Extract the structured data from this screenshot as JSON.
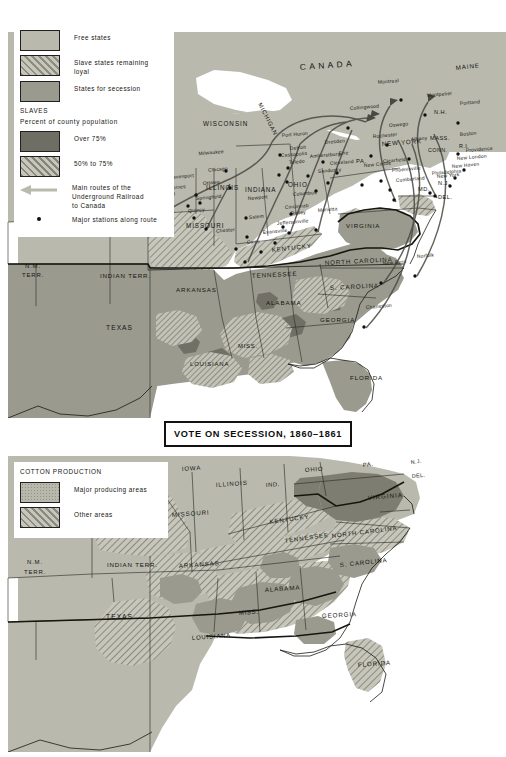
{
  "page": {
    "background": "#ffffff",
    "width": 506,
    "height": 757
  },
  "colors": {
    "free_states": "#b9b9ae",
    "loyal_slave_states_base": "#c3c3b6",
    "secession_states": "#9a9a8e",
    "over_75": "#6e6e64",
    "fifty_to_75_base": "#c0c0b4",
    "water": "#ffffff",
    "canada": "#b9b9ae",
    "outline": "#1b1b17",
    "text": "#15150f",
    "route_line": "#3a3a36",
    "cotton_major": "#9a9a8e",
    "cotton_other_base": "#c3c3b6",
    "cotton_virginia": "#7d7d72"
  },
  "top_map": {
    "name": "underground-railroad-and-secession-map",
    "title_plate": {
      "label": "VOTE ON SECESSION, 1860–1861"
    },
    "legend": {
      "name": "top-map-legend",
      "entries": [
        {
          "id": "free-states",
          "label": "Free states",
          "swatch": "plain",
          "color": "#b9b9ae"
        },
        {
          "id": "loyal-slave-states",
          "label": "Slave states remaining\n      loyal",
          "swatch": "hatch",
          "color": "#c3c3b6"
        },
        {
          "id": "secession-states",
          "label": "States for secession",
          "swatch": "plain",
          "color": "#9a9a8e"
        }
      ],
      "slaves_heading_line1": "SLAVES",
      "slaves_heading_line2": "Percent of county population",
      "slaves_entries": [
        {
          "id": "over-75",
          "label": "Over 75%",
          "swatch": "plain",
          "color": "#6e6e64"
        },
        {
          "id": "fifty-to-seventyfive",
          "label": "50% to 75%",
          "swatch": "hatch",
          "color": "#c0c0b4"
        }
      ],
      "route_label": "Main routes of the\n      Underground Railroad\n      to Canada",
      "station_label": "Major stations along route"
    },
    "region_labels": [
      {
        "text": "CANADA",
        "x": 300,
        "y": 70,
        "size": 8.4,
        "spacing": 3.4,
        "rot": -4,
        "weight": "normal"
      },
      {
        "text": "WISCONSIN",
        "x": 203,
        "y": 126,
        "size": 6.3,
        "spacing": 1.0,
        "rot": 0
      },
      {
        "text": "MICHIGAN",
        "x": 258,
        "y": 104,
        "size": 5.9,
        "spacing": 0.8,
        "rot": 63
      },
      {
        "text": "IOWA",
        "x": 151,
        "y": 160,
        "size": 6.3,
        "spacing": 1.0,
        "rot": 0
      },
      {
        "text": "ILLINOIS",
        "x": 206,
        "y": 190,
        "size": 6.3,
        "spacing": 0.9,
        "rot": 0
      },
      {
        "text": "INDIANA",
        "x": 245,
        "y": 192,
        "size": 6.3,
        "spacing": 0.8,
        "rot": 0
      },
      {
        "text": "OHIO",
        "x": 288,
        "y": 187,
        "size": 6.3,
        "spacing": 0.9,
        "rot": 0
      },
      {
        "text": "MISSOURI",
        "x": 186,
        "y": 228,
        "size": 6.3,
        "spacing": 0.9,
        "rot": 0
      },
      {
        "text": "KANSAS TERRITORY",
        "x": 60,
        "y": 232,
        "size": 6.6,
        "spacing": 1.2,
        "rot": 0
      },
      {
        "text": "N.M.",
        "x": 25,
        "y": 268,
        "size": 6.0,
        "spacing": 0.8,
        "rot": 0
      },
      {
        "text": "TERR.",
        "x": 22,
        "y": 277,
        "size": 6.0,
        "spacing": 0.8,
        "rot": 0
      },
      {
        "text": "INDIAN TERR.",
        "x": 100,
        "y": 278,
        "size": 6.2,
        "spacing": 0.8,
        "rot": 0
      },
      {
        "text": "ARKANSAS",
        "x": 176,
        "y": 292,
        "size": 6.2,
        "spacing": 0.9,
        "rot": 0
      },
      {
        "text": "TENNESSEE",
        "x": 252,
        "y": 278,
        "size": 6.2,
        "spacing": 0.9,
        "rot": -3
      },
      {
        "text": "KENTUCKY",
        "x": 272,
        "y": 252,
        "size": 6.2,
        "spacing": 0.8,
        "rot": -6
      },
      {
        "text": "VIRGINIA",
        "x": 346,
        "y": 228,
        "size": 6.2,
        "spacing": 0.9,
        "rot": 0
      },
      {
        "text": "NORTH CAROLINA",
        "x": 325,
        "y": 265,
        "size": 6.2,
        "spacing": 0.9,
        "rot": -3
      },
      {
        "text": "S. CAROLINA",
        "x": 330,
        "y": 290,
        "size": 6.2,
        "spacing": 0.9,
        "rot": -3
      },
      {
        "text": "GEORGIA",
        "x": 320,
        "y": 322,
        "size": 6.2,
        "spacing": 0.9,
        "rot": 0
      },
      {
        "text": "ALABAMA",
        "x": 266,
        "y": 305,
        "size": 6.2,
        "spacing": 0.9,
        "rot": 0
      },
      {
        "text": "MISS.",
        "x": 238,
        "y": 348,
        "size": 6.0,
        "spacing": 0.7,
        "rot": 0
      },
      {
        "text": "LOUISIANA",
        "x": 190,
        "y": 366,
        "size": 6.0,
        "spacing": 0.8,
        "rot": 0
      },
      {
        "text": "TEXAS",
        "x": 106,
        "y": 330,
        "size": 6.6,
        "spacing": 1.1,
        "rot": 0
      },
      {
        "text": "FLORIDA",
        "x": 350,
        "y": 380,
        "size": 6.2,
        "spacing": 0.9,
        "rot": 0
      },
      {
        "text": "NEW YORK",
        "x": 382,
        "y": 146,
        "size": 6.2,
        "spacing": 0.8,
        "rot": -4
      },
      {
        "text": "PA.",
        "x": 356,
        "y": 163,
        "size": 5.8,
        "spacing": 0.6,
        "rot": 0
      },
      {
        "text": "MAINE",
        "x": 456,
        "y": 70,
        "size": 6.2,
        "spacing": 0.9,
        "rot": -6
      },
      {
        "text": "N.H.",
        "x": 434,
        "y": 114,
        "size": 5.6,
        "spacing": 0.5,
        "rot": 0
      },
      {
        "text": "MASS.",
        "x": 430,
        "y": 140,
        "size": 5.6,
        "spacing": 0.5,
        "rot": 0
      },
      {
        "text": "R.I.",
        "x": 459,
        "y": 148,
        "size": 5.4,
        "spacing": 0.4,
        "rot": 0
      },
      {
        "text": "CONN.",
        "x": 428,
        "y": 152,
        "size": 5.4,
        "spacing": 0.4,
        "rot": 0
      },
      {
        "text": "N.J.",
        "x": 438,
        "y": 185,
        "size": 5.6,
        "spacing": 0.5,
        "rot": 0
      },
      {
        "text": "DEL.",
        "x": 438,
        "y": 199,
        "size": 5.6,
        "spacing": 0.5,
        "rot": 0
      },
      {
        "text": "MD.",
        "x": 418,
        "y": 191,
        "size": 5.6,
        "spacing": 0.5,
        "rot": 0
      }
    ],
    "cities": [
      {
        "name": "Montreal",
        "x": 399,
        "y": 82,
        "anchor": "end"
      },
      {
        "name": "Montpelier",
        "x": 427,
        "y": 97,
        "anchor": "start"
      },
      {
        "name": "Portland",
        "x": 460,
        "y": 105,
        "anchor": "start"
      },
      {
        "name": "Collingwood",
        "x": 350,
        "y": 110,
        "anchor": "start"
      },
      {
        "name": "Oswego",
        "x": 389,
        "y": 127,
        "anchor": "start"
      },
      {
        "name": "Rochester",
        "x": 373,
        "y": 138,
        "anchor": "start"
      },
      {
        "name": "Albany",
        "x": 411,
        "y": 141,
        "anchor": "start"
      },
      {
        "name": "Boston",
        "x": 460,
        "y": 136,
        "anchor": "start"
      },
      {
        "name": "Providence",
        "x": 466,
        "y": 152,
        "anchor": "start"
      },
      {
        "name": "New London",
        "x": 457,
        "y": 160,
        "anchor": "start"
      },
      {
        "name": "New Haven",
        "x": 452,
        "y": 168,
        "anchor": "start"
      },
      {
        "name": "New York",
        "x": 437,
        "y": 178,
        "anchor": "start"
      },
      {
        "name": "Philadelphia",
        "x": 432,
        "y": 175,
        "anchor": "start"
      },
      {
        "name": "Clearfield",
        "x": 383,
        "y": 163,
        "anchor": "start"
      },
      {
        "name": "New Castle",
        "x": 364,
        "y": 167,
        "anchor": "start"
      },
      {
        "name": "Phoenixville",
        "x": 392,
        "y": 172,
        "anchor": "start"
      },
      {
        "name": "Cumberland",
        "x": 396,
        "y": 182,
        "anchor": "start"
      },
      {
        "name": "Erie",
        "x": 339,
        "y": 155,
        "anchor": "start"
      },
      {
        "name": "Dresden",
        "x": 325,
        "y": 144,
        "anchor": "start"
      },
      {
        "name": "Port Huron",
        "x": 282,
        "y": 137,
        "anchor": "start"
      },
      {
        "name": "Detroit",
        "x": 290,
        "y": 150,
        "anchor": "start"
      },
      {
        "name": "Cassopolis",
        "x": 281,
        "y": 157,
        "anchor": "start"
      },
      {
        "name": "Amherstburg",
        "x": 310,
        "y": 158,
        "anchor": "start"
      },
      {
        "name": "Toledo",
        "x": 289,
        "y": 164,
        "anchor": "start"
      },
      {
        "name": "Cleveland",
        "x": 330,
        "y": 165,
        "anchor": "start"
      },
      {
        "name": "Sandusky",
        "x": 318,
        "y": 173,
        "anchor": "start"
      },
      {
        "name": "Columbus",
        "x": 293,
        "y": 196,
        "anchor": "start"
      },
      {
        "name": "Cincinnati",
        "x": 285,
        "y": 209,
        "anchor": "start"
      },
      {
        "name": "Ripley",
        "x": 291,
        "y": 215,
        "anchor": "start"
      },
      {
        "name": "Marietta",
        "x": 318,
        "y": 212,
        "anchor": "start"
      },
      {
        "name": "Jeffersonville",
        "x": 277,
        "y": 225,
        "anchor": "start"
      },
      {
        "name": "Evansville",
        "x": 263,
        "y": 234,
        "anchor": "start"
      },
      {
        "name": "Salem",
        "x": 249,
        "y": 219,
        "anchor": "start"
      },
      {
        "name": "Cairo",
        "x": 247,
        "y": 244,
        "anchor": "start"
      },
      {
        "name": "Chester",
        "x": 235,
        "y": 231,
        "anchor": "end"
      },
      {
        "name": "Newport",
        "x": 248,
        "y": 200,
        "anchor": "start"
      },
      {
        "name": "Chicago",
        "x": 228,
        "y": 170,
        "anchor": "end"
      },
      {
        "name": "Milwaukee",
        "x": 224,
        "y": 153,
        "anchor": "end"
      },
      {
        "name": "Ottawa",
        "x": 203,
        "y": 185,
        "anchor": "start"
      },
      {
        "name": "Springfield",
        "x": 196,
        "y": 200,
        "anchor": "start"
      },
      {
        "name": "Davenport",
        "x": 194,
        "y": 177,
        "anchor": "end"
      },
      {
        "name": "Des Moines",
        "x": 186,
        "y": 188,
        "anchor": "end"
      },
      {
        "name": "Percival",
        "x": 156,
        "y": 197,
        "anchor": "start"
      },
      {
        "name": "Quincy",
        "x": 205,
        "y": 211,
        "anchor": "end"
      },
      {
        "name": "New Bern",
        "x": 383,
        "y": 265,
        "anchor": "start"
      },
      {
        "name": "Charleston",
        "x": 366,
        "y": 309,
        "anchor": "start"
      },
      {
        "name": "Norfolk",
        "x": 417,
        "y": 258,
        "anchor": "start"
      }
    ]
  },
  "bottom_map": {
    "name": "cotton-production-map",
    "legend": {
      "name": "cotton-legend",
      "heading": "COTTON PRODUCTION",
      "entries": [
        {
          "id": "major-producing-areas",
          "label": "Major producing areas",
          "swatch": "dots",
          "color": "#9a9a8e"
        },
        {
          "id": "other-areas",
          "label": "Other areas",
          "swatch": "hatch",
          "color": "#c3c3b6"
        }
      ]
    },
    "region_labels": [
      {
        "text": "IOWA",
        "x": 182,
        "y": 471,
        "size": 6.0,
        "spacing": 0.9,
        "rot": -4
      },
      {
        "text": "ILLINOIS",
        "x": 216,
        "y": 487,
        "size": 6.0,
        "spacing": 0.9,
        "rot": -4
      },
      {
        "text": "IND.",
        "x": 266,
        "y": 487,
        "size": 5.8,
        "spacing": 0.6,
        "rot": -4
      },
      {
        "text": "OHIO",
        "x": 305,
        "y": 472,
        "size": 6.0,
        "spacing": 0.8,
        "rot": -4
      },
      {
        "text": "PA.",
        "x": 363,
        "y": 467,
        "size": 5.8,
        "spacing": 0.6,
        "rot": -6
      },
      {
        "text": "N.J.",
        "x": 411,
        "y": 464,
        "size": 5.2,
        "spacing": 0.4,
        "rot": -6
      },
      {
        "text": "DEL.",
        "x": 412,
        "y": 478,
        "size": 5.4,
        "spacing": 0.4,
        "rot": -6
      },
      {
        "text": "VIRGINIA",
        "x": 368,
        "y": 500,
        "size": 6.2,
        "spacing": 1.0,
        "rot": -5
      },
      {
        "text": "MISSOURI",
        "x": 172,
        "y": 517,
        "size": 6.2,
        "spacing": 0.9,
        "rot": -4
      },
      {
        "text": "KENTUCKY",
        "x": 270,
        "y": 524,
        "size": 6.0,
        "spacing": 0.9,
        "rot": -8
      },
      {
        "text": "TENNESSEE",
        "x": 285,
        "y": 543,
        "size": 6.0,
        "spacing": 0.9,
        "rot": -8
      },
      {
        "text": "NORTH CAROLINA",
        "x": 332,
        "y": 538,
        "size": 6.0,
        "spacing": 0.9,
        "rot": -7
      },
      {
        "text": "S. CAROLINA",
        "x": 340,
        "y": 567,
        "size": 6.0,
        "spacing": 0.9,
        "rot": -6
      },
      {
        "text": "KANSAS TERR.",
        "x": 85,
        "y": 533,
        "size": 6.2,
        "spacing": 0.9,
        "rot": 0
      },
      {
        "text": "N.M.",
        "x": 27,
        "y": 564,
        "size": 6.0,
        "spacing": 0.8,
        "rot": 0
      },
      {
        "text": "TERR.",
        "x": 24,
        "y": 574,
        "size": 6.0,
        "spacing": 0.8,
        "rot": 0
      },
      {
        "text": "INDIAN TERR.",
        "x": 107,
        "y": 567,
        "size": 6.2,
        "spacing": 0.8,
        "rot": 0
      },
      {
        "text": "ARKANSAS",
        "x": 179,
        "y": 568,
        "size": 6.2,
        "spacing": 0.9,
        "rot": -4
      },
      {
        "text": "ALABAMA",
        "x": 265,
        "y": 592,
        "size": 6.2,
        "spacing": 0.9,
        "rot": -4
      },
      {
        "text": "GEORGIA",
        "x": 322,
        "y": 618,
        "size": 6.2,
        "spacing": 0.9,
        "rot": -3
      },
      {
        "text": "MISS.",
        "x": 239,
        "y": 615,
        "size": 6.0,
        "spacing": 0.7,
        "rot": -4
      },
      {
        "text": "LOUISIANA",
        "x": 192,
        "y": 640,
        "size": 6.0,
        "spacing": 0.8,
        "rot": -4
      },
      {
        "text": "TEXAS",
        "x": 106,
        "y": 619,
        "size": 6.6,
        "spacing": 1.1,
        "rot": 0
      },
      {
        "text": "FLORIDA",
        "x": 358,
        "y": 667,
        "size": 6.2,
        "spacing": 0.9,
        "rot": -4
      }
    ]
  }
}
